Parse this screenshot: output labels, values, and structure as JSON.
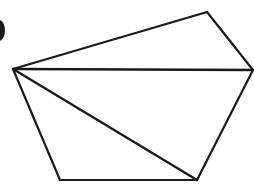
{
  "diagram": {
    "type": "pentagon-with-diagonals",
    "stroke_color": "#1a1a1a",
    "background": "#ffffff",
    "vertices": {
      "A": [
        13,
        69
      ],
      "B": [
        207,
        12
      ],
      "C": [
        253,
        70
      ],
      "D": [
        197,
        180
      ],
      "E": [
        60,
        180
      ]
    },
    "edges": [
      [
        "A",
        "B"
      ],
      [
        "B",
        "C"
      ],
      [
        "C",
        "D"
      ],
      [
        "D",
        "E"
      ],
      [
        "E",
        "A"
      ]
    ],
    "diagonals": [
      [
        "A",
        "C"
      ],
      [
        "A",
        "D"
      ]
    ],
    "partial_mark": {
      "shape": "arc",
      "position": [
        0,
        30
      ]
    }
  }
}
